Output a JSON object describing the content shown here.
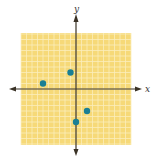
{
  "chart_data": {
    "type": "scatter",
    "title": "",
    "xlabel": "x",
    "ylabel": "y",
    "xlim": [
      -10,
      10
    ],
    "ylim": [
      -10,
      10
    ],
    "grid": true,
    "tick_labels": false,
    "series": [
      {
        "name": "points",
        "points": [
          {
            "x": -6,
            "y": 1
          },
          {
            "x": -1,
            "y": 3
          },
          {
            "x": 2,
            "y": -4
          },
          {
            "x": 0,
            "y": -6
          }
        ]
      }
    ]
  },
  "colors": {
    "grid_background": "#f6d978",
    "grid_lines": "#fbeebb",
    "axis": "#3a3226",
    "point": "#1a7f94"
  },
  "labels": {
    "x_axis": "x",
    "y_axis": "y"
  }
}
